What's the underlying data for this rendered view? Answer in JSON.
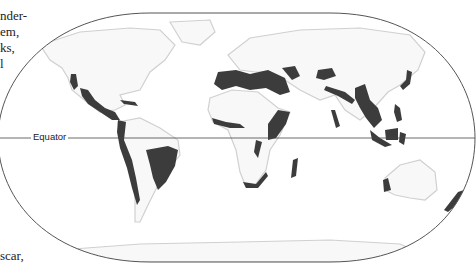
{
  "side_text": {
    "lines_top": [
      "nder-",
      "em,",
      "ks,",
      "l"
    ],
    "line_bottom": "scar,"
  },
  "map": {
    "projection_outline": "rounded world projection",
    "equator_label": "Equator",
    "colors": {
      "outline": "#555555",
      "land": "#f7f7f7",
      "land_edge": "#d4d4d4",
      "hotspot": "#3c3c3c",
      "equator": "#444444"
    },
    "hotspot_regions": [
      "California Floristic Province",
      "Mesoamerica",
      "Caribbean Islands",
      "Tropical Andes",
      "Chilean Winter Rainfall",
      "Atlantic Forest / Cerrado",
      "Mediterranean Basin",
      "Caucasus",
      "Irano-Anatolian",
      "Mountains of Central Asia",
      "Himalaya",
      "Western Ghats and Sri Lanka",
      "Indo-Burma",
      "Mountains of Southwest China",
      "Japan",
      "Philippines",
      "Sundaland",
      "Wallacea",
      "Guinean Forests of West Africa",
      "Horn of Africa",
      "Eastern Afromontane",
      "Coastal Forests of Eastern Africa",
      "Maputaland-Pondoland-Albany",
      "Cape Floristic Region",
      "Madagascar",
      "Southwest Australia",
      "New Zealand",
      "New Caledonia",
      "Polynesia-Micronesia"
    ]
  }
}
